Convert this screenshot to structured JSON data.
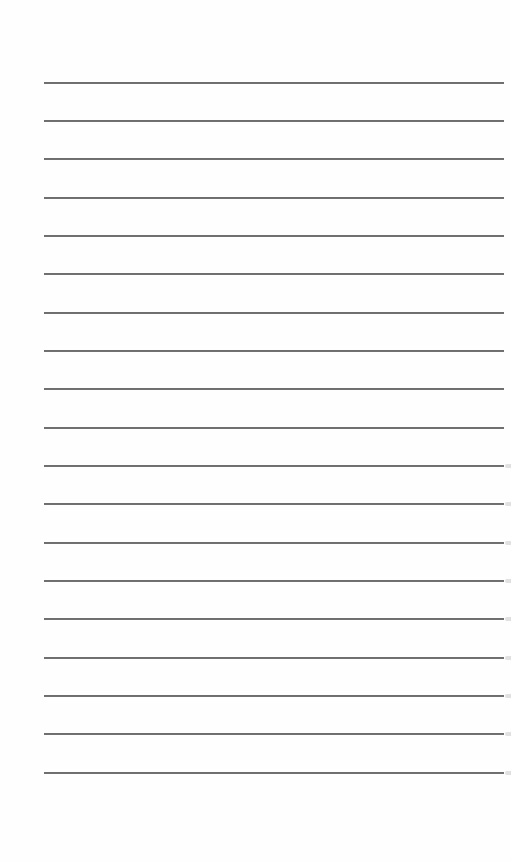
{
  "page": {
    "type": "blank ruled notebook page",
    "background_color": "#fefefe",
    "rule_color": "#6e6e6e"
  },
  "rules": {
    "count": 19,
    "left": 44,
    "width": 460,
    "y_positions": [
      82,
      120,
      158,
      197,
      235,
      273,
      312,
      350,
      388,
      427,
      465,
      503,
      542,
      580,
      618,
      657,
      695,
      733,
      772
    ]
  },
  "edge_marks": {
    "y_positions": [
      465,
      503,
      542,
      580,
      618,
      657,
      695,
      733,
      772
    ]
  }
}
